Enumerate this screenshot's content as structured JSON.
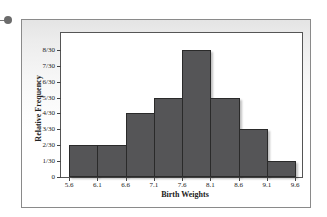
{
  "chart_data": {
    "type": "bar",
    "title": "",
    "xlabel": "Birth Weights",
    "ylabel": "Relative Frequency",
    "bin_edges": [
      5.6,
      6.1,
      6.6,
      7.1,
      7.6,
      8.1,
      8.6,
      9.1,
      9.6
    ],
    "categories": [
      "5.6-6.1",
      "6.1-6.6",
      "6.6-7.1",
      "7.1-7.6",
      "7.6-8.1",
      "8.1-8.6",
      "8.6-9.1",
      "9.1-9.6"
    ],
    "values": [
      0.0667,
      0.0667,
      0.1333,
      0.1667,
      0.2667,
      0.1667,
      0.1,
      0.0333
    ],
    "values_fraction": [
      "2/30",
      "2/30",
      "4/30",
      "5/30",
      "8/30",
      "5/30",
      "3/30",
      "1/30"
    ],
    "counts_out_of_30": [
      2,
      2,
      4,
      5,
      8,
      5,
      3,
      1
    ],
    "x_tick_labels": [
      "5.6",
      "6.1",
      "6.6",
      "7.1",
      "7.6",
      "8.1",
      "8.6",
      "9.1",
      "9.6"
    ],
    "y_tick_labels": [
      "0",
      "1/30",
      "2/30",
      "3/30",
      "4/30",
      "5/30",
      "6/30",
      "7/30",
      "8/30"
    ],
    "ylim": [
      0,
      0.3
    ],
    "grid": false,
    "legend": null,
    "histogram": true,
    "bar_color": "#555557"
  }
}
